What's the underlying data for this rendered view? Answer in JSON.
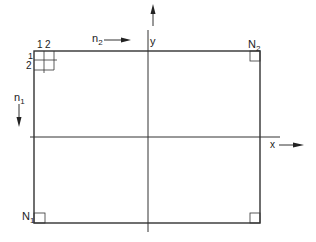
{
  "diagram": {
    "type": "grid-coordinate-diagram",
    "labels": {
      "n1": "n",
      "n1_sub": "1",
      "n2": "n",
      "n2_sub": "2",
      "N1": "N",
      "N1_sub": "1",
      "N2": "N",
      "N2_sub": "2",
      "x_axis": "x",
      "y_axis": "y",
      "col_1": "1",
      "col_2": "2",
      "row_1": "1",
      "row_2": "2"
    },
    "colors": {
      "line": "#333333",
      "background": "#ffffff"
    }
  }
}
